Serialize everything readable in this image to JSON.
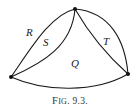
{
  "figure": {
    "caption_prefix": "F",
    "caption_smallcaps": "IG",
    "caption_number": ". 9.3.",
    "caption": "FIG. 9.3.",
    "vertices": [
      {
        "name": "top",
        "x": 75,
        "y": 9
      },
      {
        "name": "left",
        "x": 11,
        "y": 77
      },
      {
        "name": "right",
        "x": 128,
        "y": 74
      }
    ],
    "region_labels": [
      {
        "text": "R",
        "x": 26,
        "y": 36
      },
      {
        "text": "S",
        "x": 43,
        "y": 46
      },
      {
        "text": "T",
        "x": 103,
        "y": 45
      },
      {
        "text": "Q",
        "x": 71,
        "y": 67
      }
    ]
  }
}
